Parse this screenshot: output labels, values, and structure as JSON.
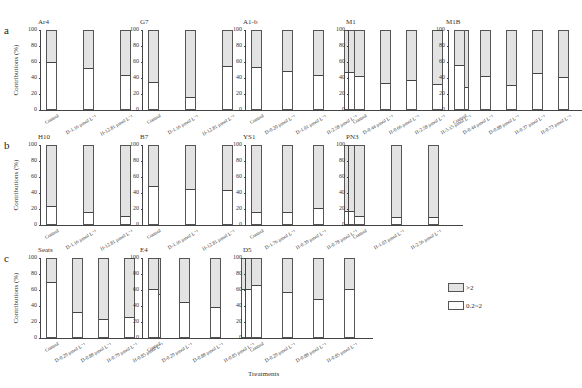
{
  "chart_data": {
    "type": "bar",
    "stacked": true,
    "ylabel": "Contributions (%)",
    "xlabel": "Treatments",
    "ylim": [
      0,
      100
    ],
    "yticks": [
      0,
      20,
      40,
      60,
      80,
      100
    ],
    "legend": [
      {
        "label": ">2",
        "color": "#e3e3e3"
      },
      {
        "label": "0.2~2",
        "color": "#ffffff"
      }
    ],
    "rows": [
      {
        "letter": "a",
        "panels": [
          {
            "title": "Ar4",
            "categories": [
              "Control",
              "D-1.16 μmol L⁻¹",
              "H-12.81 μmol L⁻¹"
            ],
            "series": [
              {
                "name": "0.2~2",
                "values": [
                  60,
                  53,
                  44
                ]
              },
              {
                "name": ">2",
                "values": [
                  40,
                  47,
                  56
                ]
              }
            ]
          },
          {
            "title": "G7",
            "categories": [
              "Control",
              "D-1.16 μmol L⁻¹",
              "H-12.81 μmol L⁻¹"
            ],
            "series": [
              {
                "name": "0.2~2",
                "values": [
                  35,
                  15,
                  55
                ]
              },
              {
                "name": ">2",
                "values": [
                  65,
                  85,
                  45
                ]
              }
            ]
          },
          {
            "title": "A1-b",
            "categories": [
              "Control",
              "D-0.20 μmol L⁻¹",
              "D-1.01 μmol L⁻¹",
              "H-2.58 μmol L⁻¹"
            ],
            "series": [
              {
                "name": "0.2~2",
                "values": [
                  54,
                  49,
                  43,
                  47
                ]
              },
              {
                "name": ">2",
                "values": [
                  46,
                  51,
                  57,
                  53
                ]
              }
            ]
          },
          {
            "title": "M1",
            "categories": [
              "Control",
              "D-0.44 μmol L⁻¹",
              "H-0.66 μmol L⁻¹",
              "H-2.58 μmol L⁻¹",
              "H-5.15 μmol L⁻¹"
            ],
            "series": [
              {
                "name": "0.2~2",
                "values": [
                  42,
                  33,
                  37,
                  32,
                  28
                ]
              },
              {
                "name": ">2",
                "values": [
                  58,
                  67,
                  63,
                  68,
                  72
                ]
              }
            ]
          },
          {
            "title": "M1B",
            "categories": [
              "Control",
              "D-0.44 μmol L⁻¹",
              "D-0.88 μmol L⁻¹",
              "H-0.37 μmol L⁻¹",
              "H-0.73 μmol L⁻¹"
            ],
            "series": [
              {
                "name": "0.2~2",
                "values": [
                  57,
                  42,
                  31,
                  46,
                  41
                ]
              },
              {
                "name": ">2",
                "values": [
                  43,
                  58,
                  69,
                  54,
                  59
                ]
              }
            ]
          }
        ]
      },
      {
        "letter": "b",
        "panels": [
          {
            "title": "H10",
            "categories": [
              "Control",
              "D-1.16 μmol L⁻¹",
              "H-12.81 μmol L⁻¹"
            ],
            "series": [
              {
                "name": "0.2~2",
                "values": [
                  23,
                  15,
                  10
                ]
              },
              {
                "name": ">2",
                "values": [
                  77,
                  85,
                  90
                ]
              }
            ]
          },
          {
            "title": "B7",
            "categories": [
              "Control",
              "D-1.16 μmol L⁻¹",
              "H-12.81 μmol L⁻¹"
            ],
            "series": [
              {
                "name": "0.2~2",
                "values": [
                  49,
                  45,
                  44
                ]
              },
              {
                "name": ">2",
                "values": [
                  51,
                  55,
                  56
                ]
              }
            ]
          },
          {
            "title": "YS1",
            "categories": [
              "Control",
              "D-1.76 μmol L⁻¹",
              "H-0.39 μmol L⁻¹",
              "H-0.78 μmol L⁻¹"
            ],
            "series": [
              {
                "name": "0.2~2",
                "values": [
                  15,
                  15,
                  21,
                  17
                ]
              },
              {
                "name": ">2",
                "values": [
                  85,
                  85,
                  79,
                  83
                ]
              }
            ]
          },
          {
            "title": "PN3",
            "categories": [
              "Control",
              "H-1.03 μmol L⁻¹",
              "H-2.56 μmol L⁻¹"
            ],
            "series": [
              {
                "name": "0.2~2",
                "values": [
                  10,
                  9,
                  9
                ]
              },
              {
                "name": ">2",
                "values": [
                  90,
                  91,
                  91
                ]
              }
            ]
          }
        ]
      },
      {
        "letter": "c",
        "panels": [
          {
            "title": "Seats",
            "categories": [
              "Control",
              "D-0.29 μmol L⁻¹",
              "D-0.88 μmol L⁻¹",
              "H-0.79 μmol L⁻¹",
              "H-0.85 μmol L⁻¹"
            ],
            "series": [
              {
                "name": "0.2~2",
                "values": [
                  71,
                  32,
                  23,
                  26,
                  55
                ]
              },
              {
                "name": ">2",
                "values": [
                  29,
                  68,
                  77,
                  74,
                  45
                ]
              }
            ]
          },
          {
            "title": "E4",
            "categories": [
              "Control",
              "D-0.29 μmol L⁻¹",
              "D-0.88 μmol L⁻¹",
              "H-0.85 μmol L⁻¹"
            ],
            "series": [
              {
                "name": "0.2~2",
                "values": [
                  61,
                  45,
                  39,
                  61
                ]
              },
              {
                "name": ">2",
                "values": [
                  39,
                  55,
                  61,
                  39
                ]
              }
            ]
          },
          {
            "title": "D5",
            "categories": [
              "Control",
              "D-0.29 μmol L⁻¹",
              "D-0.88 μmol L⁻¹",
              "H-0.85 μmol L⁻¹"
            ],
            "series": [
              {
                "name": "0.2~2",
                "values": [
                  67,
                  58,
                  49,
                  62
                ]
              },
              {
                "name": ">2",
                "values": [
                  33,
                  42,
                  51,
                  38
                ]
              }
            ]
          }
        ]
      }
    ]
  },
  "labels": {
    "legend_gt2": ">2",
    "legend_small": "0.2~2",
    "x_title": "Treatments"
  }
}
